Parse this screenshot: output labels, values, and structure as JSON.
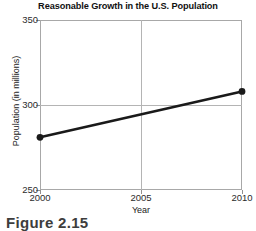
{
  "chart_data": {
    "type": "line",
    "title": "Reasonable Growth in the U.S. Population",
    "xlabel": "Year",
    "ylabel": "Population (in millions)",
    "x": [
      2000,
      2010
    ],
    "values": [
      281,
      308
    ],
    "series": [
      {
        "name": "U.S. Population",
        "points": [
          {
            "x": 2000,
            "y": 281
          },
          {
            "x": 2010,
            "y": 308
          }
        ]
      }
    ],
    "xlim": [
      2000,
      2010
    ],
    "ylim": [
      250,
      350
    ],
    "xticks": [
      2000,
      2005,
      2010
    ],
    "yticks": [
      250,
      300,
      350
    ],
    "xtick_labels": [
      "2000",
      "2005",
      "2010"
    ],
    "ytick_labels": [
      "250",
      "300",
      "350"
    ],
    "grid": true,
    "gridlines_x": [
      2005
    ],
    "gridlines_y": [
      300
    ],
    "legend": null,
    "legend_position": "none",
    "line_color": "#1a1a1a",
    "marker": "circle",
    "marker_color": "#1a1a1a",
    "frame_color": "#a8a8a8",
    "grid_color": "#b4b4b4",
    "background": "#ffffff"
  },
  "caption": {
    "text": "Figure 2.15"
  }
}
